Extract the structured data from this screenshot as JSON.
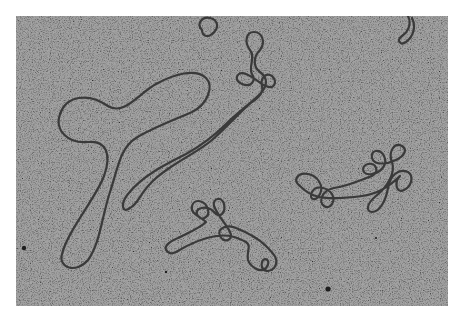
{
  "image": {
    "kind": "electron-micrograph",
    "subject": "DNA molecules (circular and supercoiled strands)",
    "colors": {
      "background": "#b9b9b9",
      "strand": "#3a3a3a",
      "page": "#ffffff"
    }
  }
}
